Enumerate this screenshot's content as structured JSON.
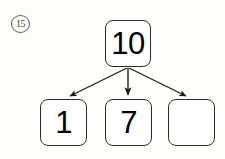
{
  "worksheet": {
    "question_number": "15",
    "question_marker_shape": "circled-number",
    "diagram_type": "number-bond",
    "canvas": {
      "width": 225,
      "height": 159,
      "background_color": "#fdfdfc"
    }
  },
  "diagram": {
    "total": {
      "label": "10",
      "filled": true
    },
    "parts": [
      {
        "label": "1",
        "filled": true
      },
      {
        "label": "7",
        "filled": true
      },
      {
        "label": "",
        "filled": false
      }
    ],
    "arrows": [
      {
        "name": "arrow-to-part-1",
        "direction": "down-left"
      },
      {
        "name": "arrow-to-part-2",
        "direction": "down"
      },
      {
        "name": "arrow-to-part-3",
        "direction": "down-right"
      }
    ]
  },
  "colors": {
    "ink": "#000000",
    "box_border": "#2b2b2b",
    "marker_border": "#5a5a5a",
    "arrow": "#1a1a1a",
    "paper": "#fdfdfc"
  }
}
